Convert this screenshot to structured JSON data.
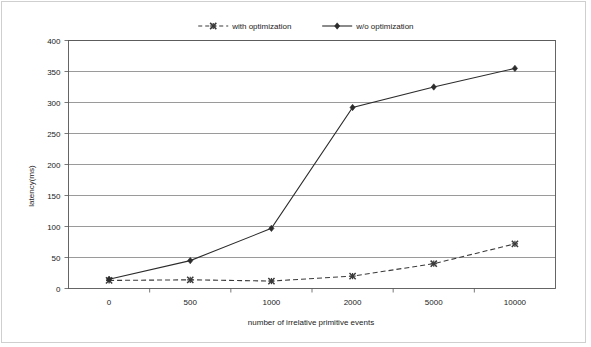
{
  "chart_data": {
    "type": "line",
    "title": "",
    "xlabel": "number of irrelative primitive events",
    "ylabel": "latency(ms)",
    "categories": [
      "0",
      "500",
      "1000",
      "2000",
      "5000",
      "10000"
    ],
    "ylim": [
      0,
      400
    ],
    "yticks": [
      "0",
      "50",
      "100",
      "150",
      "200",
      "250",
      "300",
      "350",
      "400"
    ],
    "grid": true,
    "legend_position": "top-center",
    "series": [
      {
        "name": "with optimization",
        "marker": "x-marker",
        "linestyle": "dashed",
        "color": "#3a3a3a",
        "values": [
          13,
          14,
          12,
          20,
          40,
          72
        ]
      },
      {
        "name": "w/o optimization",
        "marker": "diamond-marker",
        "linestyle": "solid",
        "color": "#2b2b2b",
        "values": [
          15,
          45,
          97,
          292,
          325,
          355
        ]
      }
    ]
  },
  "legend": {
    "entries": [
      {
        "label": "with optimization"
      },
      {
        "label": "w/o optimization"
      }
    ]
  },
  "axes": {
    "y_title": "latency(ms)",
    "x_title": "number of irrelative primitive events"
  }
}
